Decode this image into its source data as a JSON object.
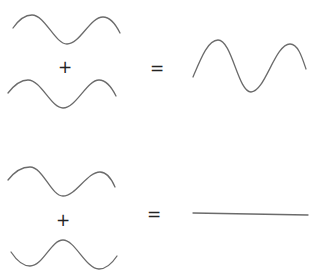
{
  "diagram": {
    "stroke_color": "#6b6b6b",
    "rows": [
      {
        "name": "constructive-interference",
        "operator_plus": "+",
        "operator_equals": "=",
        "input_wave_1": "sine wave",
        "input_wave_2": "sine wave (in phase)",
        "result": "sine wave with larger amplitude"
      },
      {
        "name": "destructive-interference",
        "operator_plus": "+",
        "operator_equals": "=",
        "input_wave_1": "sine wave",
        "input_wave_2": "sine wave (out of phase)",
        "result": "flat line"
      }
    ]
  }
}
